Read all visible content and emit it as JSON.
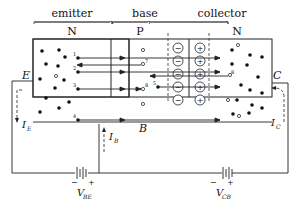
{
  "diagram": {
    "regions": [
      {
        "name": "emitter",
        "type": "N"
      },
      {
        "name": "base",
        "type": "P"
      },
      {
        "name": "collector",
        "type": "N"
      }
    ],
    "terminals": {
      "emitter": "E",
      "base": "B",
      "collector": "C"
    },
    "currents": {
      "emitter": {
        "symbol": "I",
        "sub": "E"
      },
      "base": {
        "symbol": "I",
        "sub": "B"
      },
      "collector": {
        "symbol": "I",
        "sub": "C"
      }
    },
    "sources": {
      "vbe": {
        "symbol": "V",
        "sub": "BE",
        "minus": "−",
        "plus": "+"
      },
      "vcb": {
        "symbol": "V",
        "sub": "CB",
        "minus": "−",
        "plus": "+"
      }
    },
    "depletion": {
      "negative_ion": "−",
      "positive_ion": "+",
      "count": 5
    },
    "carrier_labels": [
      "1",
      "2",
      "3",
      "4",
      "5",
      "6",
      "7",
      "8"
    ],
    "colors": {
      "line": "#222222",
      "fill": "#ffffff"
    }
  }
}
